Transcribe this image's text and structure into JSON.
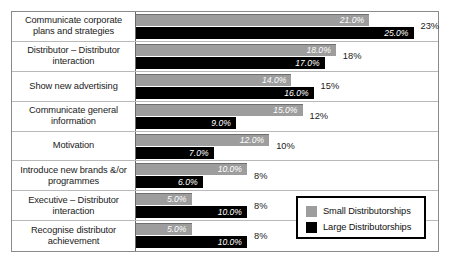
{
  "chart_data": {
    "type": "bar",
    "orientation": "horizontal",
    "title": "",
    "xlabel": "",
    "ylabel": "",
    "grid": false,
    "legend_position": "bottom-right",
    "xlim": [
      0,
      27
    ],
    "categories": [
      "Communicate corporate plans and strategies",
      "Distributor – Distributor interaction",
      "Show new advertising",
      "Communicate general information",
      "Motivation",
      "Introduce new brands &/or programmes",
      "Executive – Distributor interaction",
      "Recognise distributor achievement"
    ],
    "series": [
      {
        "name": "Small Distributorships",
        "color": "#9d9d9d",
        "values": [
          21.0,
          18.0,
          14.0,
          15.0,
          12.0,
          10.0,
          5.0,
          5.0
        ],
        "labels": [
          "21.0%",
          "18.0%",
          "14.0%",
          "15.0%",
          "12.0%",
          "10.0%",
          "5.0%",
          "5.0%"
        ]
      },
      {
        "name": "Large Distributorships",
        "color": "#000000",
        "values": [
          25.0,
          17.0,
          16.0,
          9.0,
          7.0,
          6.0,
          10.0,
          10.0
        ],
        "labels": [
          "25.0%",
          "17.0%",
          "16.0%",
          "9.0%",
          "7.0%",
          "6.0%",
          "10.0%",
          "10.0%"
        ]
      }
    ],
    "row_totals": [
      "23%",
      "18%",
      "15%",
      "12%",
      "10%",
      "8%",
      "8%",
      "8%"
    ]
  },
  "legend": {
    "entries": [
      {
        "label": "Small Distributorships",
        "color": "#9d9d9d"
      },
      {
        "label": "Large Distributorships",
        "color": "#000000"
      }
    ]
  }
}
